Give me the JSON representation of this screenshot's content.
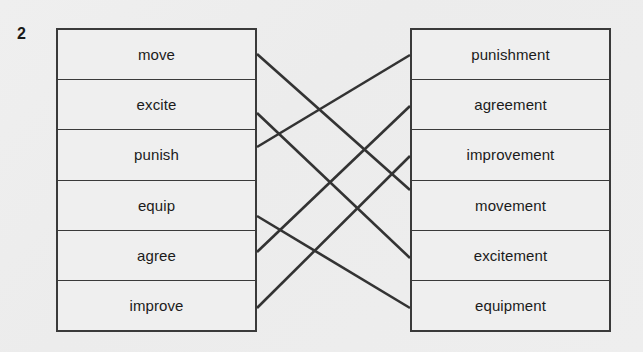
{
  "exercise": {
    "number": "2",
    "type": "match-the-pairs",
    "instruction_visible": false
  },
  "left_column": {
    "name": "base-words",
    "items": [
      {
        "id": "move",
        "label": "move"
      },
      {
        "id": "excite",
        "label": "excite"
      },
      {
        "id": "punish",
        "label": "punish"
      },
      {
        "id": "equip",
        "label": "equip"
      },
      {
        "id": "agree",
        "label": "agree"
      },
      {
        "id": "improve",
        "label": "improve"
      }
    ]
  },
  "right_column": {
    "name": "derived-nouns",
    "items": [
      {
        "id": "punishment",
        "label": "punishment"
      },
      {
        "id": "agreement",
        "label": "agreement"
      },
      {
        "id": "improvement",
        "label": "improvement"
      },
      {
        "id": "movement",
        "label": "movement"
      },
      {
        "id": "excitement",
        "label": "excitement"
      },
      {
        "id": "equipment",
        "label": "equipment"
      }
    ]
  },
  "connections": [
    {
      "from": "move",
      "to": "movement",
      "x1": 257,
      "y1": 54,
      "x2": 410,
      "y2": 190
    },
    {
      "from": "excite",
      "to": "excitement",
      "x1": 257,
      "y1": 113,
      "x2": 410,
      "y2": 258
    },
    {
      "from": "punish",
      "to": "punishment",
      "x1": 257,
      "y1": 147,
      "x2": 410,
      "y2": 55
    },
    {
      "from": "equip",
      "to": "equipment",
      "x1": 257,
      "y1": 216,
      "x2": 410,
      "y2": 308
    },
    {
      "from": "agree",
      "to": "agreement",
      "x1": 257,
      "y1": 252,
      "x2": 410,
      "y2": 106
    },
    {
      "from": "improve",
      "to": "improvement",
      "x1": 257,
      "y1": 308,
      "x2": 410,
      "y2": 156
    }
  ],
  "colors": {
    "page_background": "#eeeeee",
    "box_border": "#3a3a3a",
    "box_fill": "#efefef",
    "text": "#1b1b1b",
    "connector_line": "#333333"
  }
}
